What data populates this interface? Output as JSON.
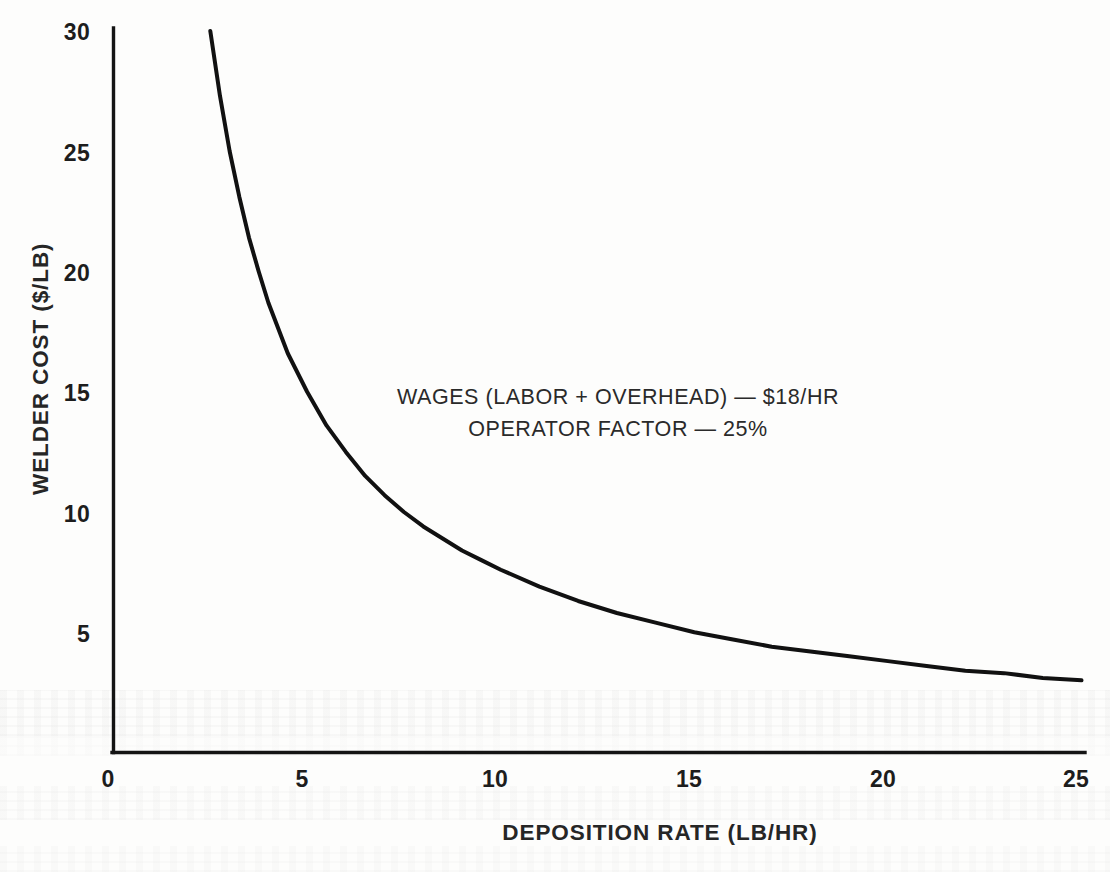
{
  "figure": {
    "background_color": "#fdfdfc",
    "ink_color": "#1a1a1a"
  },
  "axes": {
    "y_title": "WELDER COST ($/LB)",
    "x_title": "DEPOSITION RATE (LB/HR)",
    "y_ticks": [
      "30",
      "25",
      "20",
      "15",
      "10",
      "5"
    ],
    "x_ticks": [
      "0",
      "5",
      "10",
      "15",
      "20",
      "25"
    ]
  },
  "annotation": {
    "line1": "WAGES (LABOR + OVERHEAD) — $18/HR",
    "line2": "OPERATOR FACTOR — 25%"
  },
  "chart_data": {
    "type": "line",
    "title": "",
    "xlabel": "DEPOSITION RATE (LB/HR)",
    "ylabel": "WELDER COST ($/LB)",
    "xlim": [
      0,
      25
    ],
    "ylim": [
      0,
      30
    ],
    "xticks": [
      0,
      5,
      10,
      15,
      20,
      25
    ],
    "yticks": [
      0,
      5,
      10,
      15,
      20,
      25,
      30
    ],
    "grid": false,
    "legend": null,
    "annotations": [
      "WAGES (LABOR + OVERHEAD) — $18/HR",
      "OPERATOR FACTOR — 25%"
    ],
    "relation": "welder_cost = wages / (deposition_rate * operator_factor) = 18 / (rate * 0.25) = 72 / rate",
    "parameters": {
      "wages_labor_plus_overhead_usd_per_hr": 18,
      "operator_factor_percent": 25,
      "numerator_usd_per_lb_times_lb_per_hr": 72
    },
    "series": [
      {
        "name": "Welder cost",
        "color": "#111111",
        "line_width_px": 4,
        "x": [
          2.5,
          2.75,
          3.0,
          3.25,
          3.5,
          3.75,
          4.0,
          4.5,
          5.0,
          5.5,
          6.0,
          6.5,
          7.0,
          7.5,
          8.0,
          8.5,
          9.0,
          9.5,
          10.0,
          11.0,
          12.0,
          13.0,
          14.0,
          15.0,
          16.0,
          17.0,
          18.0,
          19.0,
          20.0,
          21.0,
          22.0,
          23.0,
          24.0,
          25.0
        ],
        "y": [
          30.0,
          27.3,
          25.0,
          23.1,
          21.4,
          20.0,
          18.7,
          16.6,
          15.0,
          13.6,
          12.5,
          11.5,
          10.7,
          10.0,
          9.4,
          8.9,
          8.4,
          8.0,
          7.6,
          6.9,
          6.3,
          5.8,
          5.4,
          5.0,
          4.7,
          4.4,
          4.2,
          4.0,
          3.8,
          3.6,
          3.4,
          3.3,
          3.1,
          3.0
        ]
      }
    ]
  }
}
